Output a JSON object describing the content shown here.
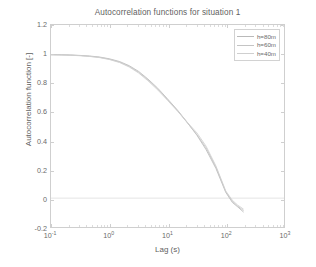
{
  "chart_data": {
    "type": "line",
    "title": "Autocorrelation functions for situation 1",
    "xlabel": "Lag (s)",
    "ylabel": "Autocorrelation function [-]",
    "xscale": "log",
    "yscale": "linear",
    "xlim": [
      0.1,
      1000
    ],
    "ylim": [
      -0.2,
      1.2
    ],
    "grid": false,
    "legend_position": "upper-right",
    "xticks": [
      "10^-1",
      "10^0",
      "10^1",
      "10^2",
      "10^3"
    ],
    "xtick_labels": [
      {
        "base": "10",
        "exp": "-1"
      },
      {
        "base": "10",
        "exp": "0"
      },
      {
        "base": "10",
        "exp": "1"
      },
      {
        "base": "10",
        "exp": "2"
      },
      {
        "base": "10",
        "exp": "3"
      }
    ],
    "yticks": [
      -0.2,
      0,
      0.2,
      0.4,
      0.6,
      0.8,
      1,
      1.2
    ],
    "ytick_labels": [
      "-0.2",
      "0",
      "0.2",
      "0.4",
      "0.6",
      "0.8",
      "1",
      "1.2"
    ],
    "series": [
      {
        "name": "h=80m",
        "color": "#b9b9b9",
        "x": [
          0.1,
          0.15,
          0.22,
          0.32,
          0.46,
          0.68,
          1.0,
          1.5,
          2.2,
          3.2,
          4.6,
          6.8,
          10,
          15,
          22,
          32,
          46,
          68,
          100,
          130,
          160,
          200
        ],
        "y": [
          0.995,
          0.994,
          0.992,
          0.989,
          0.985,
          0.978,
          0.966,
          0.947,
          0.918,
          0.878,
          0.826,
          0.762,
          0.688,
          0.608,
          0.523,
          0.436,
          0.336,
          0.205,
          0.04,
          -0.03,
          -0.06,
          -0.095
        ]
      },
      {
        "name": "h=60m",
        "color": "#c4c4c4",
        "x": [
          0.1,
          0.15,
          0.22,
          0.32,
          0.46,
          0.68,
          1.0,
          1.5,
          2.2,
          3.2,
          4.6,
          6.8,
          10,
          15,
          22,
          32,
          46,
          68,
          100,
          130,
          160,
          200
        ],
        "y": [
          0.994,
          0.993,
          0.991,
          0.988,
          0.983,
          0.976,
          0.963,
          0.943,
          0.913,
          0.872,
          0.82,
          0.756,
          0.683,
          0.604,
          0.521,
          0.44,
          0.348,
          0.215,
          0.045,
          -0.022,
          -0.055,
          -0.085
        ]
      },
      {
        "name": "h=40m",
        "color": "#cfcfcf",
        "x": [
          0.1,
          0.15,
          0.22,
          0.32,
          0.46,
          0.68,
          1.0,
          1.5,
          2.2,
          3.2,
          4.6,
          6.8,
          10,
          15,
          22,
          32,
          46,
          68,
          100,
          130,
          160,
          200
        ],
        "y": [
          0.993,
          0.992,
          0.99,
          0.987,
          0.982,
          0.974,
          0.961,
          0.94,
          0.909,
          0.867,
          0.814,
          0.75,
          0.678,
          0.601,
          0.525,
          0.452,
          0.36,
          0.222,
          0.05,
          -0.015,
          -0.048,
          -0.075
        ]
      }
    ],
    "zero_line": {
      "value": 0,
      "color": "#dedede"
    }
  },
  "legend": {
    "entries": [
      {
        "label": "h=80m"
      },
      {
        "label": "h=60m"
      },
      {
        "label": "h=40m"
      }
    ]
  }
}
